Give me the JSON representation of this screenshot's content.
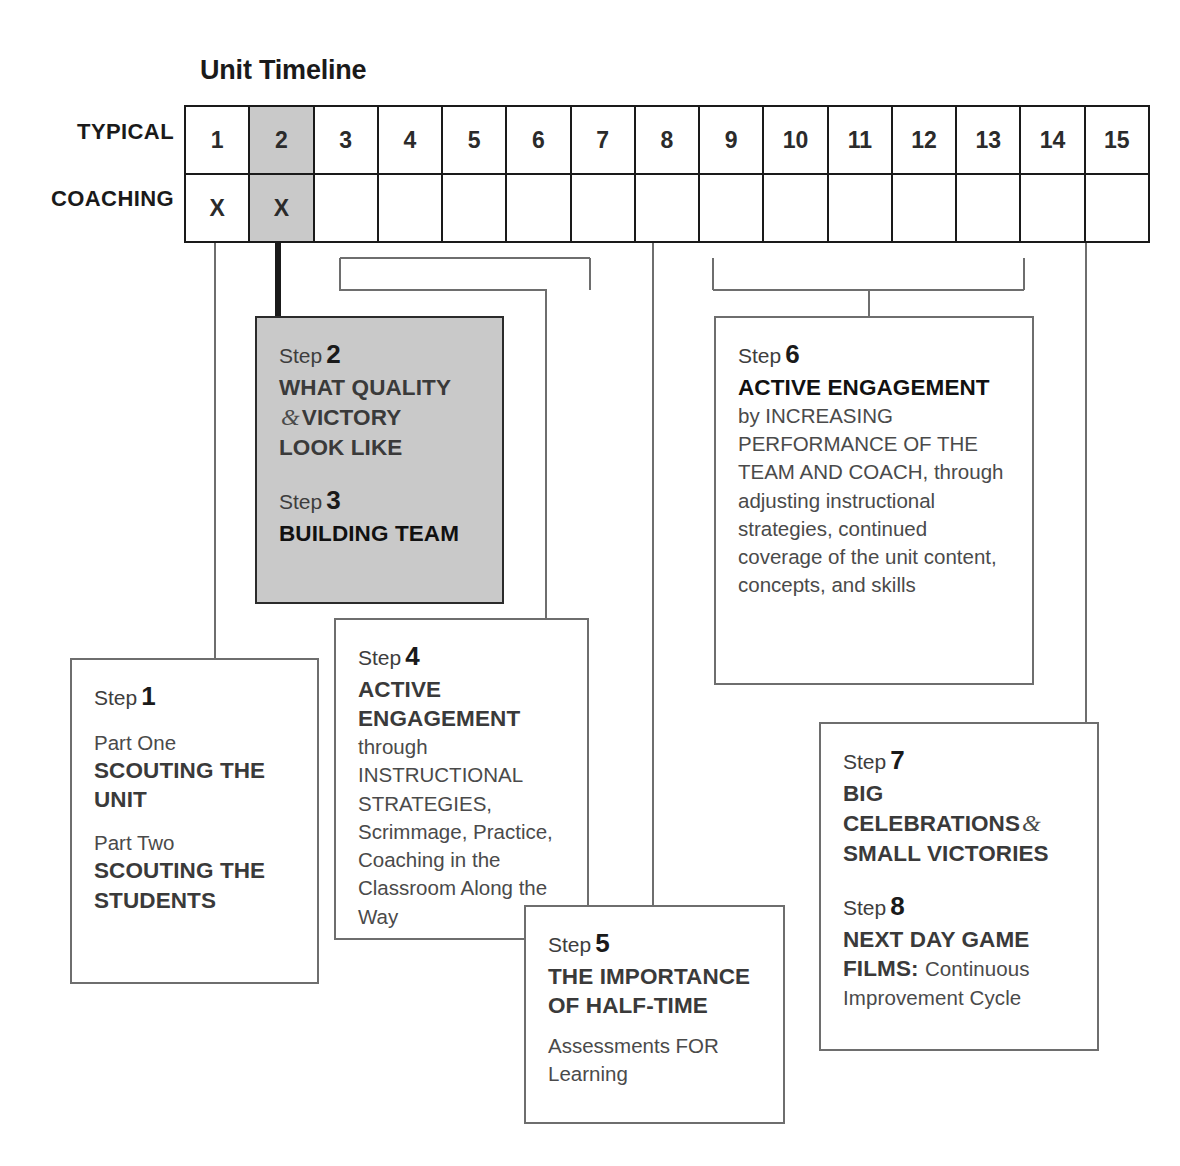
{
  "title": "Unit Timeline",
  "timeline": {
    "rows": [
      {
        "label": "TYPICAL",
        "cells": [
          "1",
          "2",
          "3",
          "4",
          "5",
          "6",
          "7",
          "8",
          "9",
          "10",
          "11",
          "12",
          "13",
          "14",
          "15"
        ]
      },
      {
        "label": "COACHING",
        "cells": [
          "X",
          "X",
          "",
          "",
          "",
          "",
          "",
          "",
          "",
          "",
          "",
          "",
          "",
          "",
          ""
        ]
      }
    ],
    "highlighted_column_index": 1,
    "highlight_color": "#c9c9c9"
  },
  "boxes": {
    "step23": {
      "step2_label": "Step",
      "step2_number": "2",
      "step2_line1": "WHAT QUALITY",
      "step2_amp": "&",
      "step2_line2": "VICTORY",
      "step2_line3": "LOOK LIKE",
      "step3_label": "Step",
      "step3_number": "3",
      "step3_title": "BUILDING TEAM"
    },
    "step6": {
      "label": "Step",
      "number": "6",
      "title": "ACTIVE ENGAGEMENT",
      "body": "by INCREASING PERFORMANCE OF THE TEAM AND COACH, through adjusting instructional strategies, continued coverage of the unit content, concepts, and skills"
    },
    "step1": {
      "label": "Step",
      "number": "1",
      "part_one_label": "Part One",
      "part_one_title": "SCOUTING THE UNIT",
      "part_two_label": "Part Two",
      "part_two_title": "SCOUTING THE STUDENTS"
    },
    "step4": {
      "label": "Step",
      "number": "4",
      "title": "ACTIVE ENGAGEMENT",
      "body": "through INSTRUCTIONAL STRATEGIES, Scrimmage, Practice, Coaching in the Classroom Along the Way"
    },
    "step5": {
      "label": "Step",
      "number": "5",
      "title": "THE IMPORTANCE OF HALF-TIME",
      "body": "Assessments FOR Learning"
    },
    "step78": {
      "step7_label": "Step",
      "step7_number": "7",
      "step7_title_a": "BIG CELEBRATIONS",
      "step7_amp": "&",
      "step7_title_b": "SMALL VICTORIES",
      "step8_label": "Step",
      "step8_number": "8",
      "step8_title_a": "NEXT DAY GAME",
      "step8_title_b": "FILMS:",
      "step8_body": "Continuous Improvement Cycle"
    }
  },
  "colors": {
    "line": "#6e6e6e",
    "line_dark": "#1a1a1a",
    "shade": "#c9c9c9",
    "text": "#3a3a3a"
  }
}
